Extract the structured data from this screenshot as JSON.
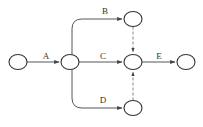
{
  "diagram": {
    "type": "activity-on-arrow network",
    "colors": {
      "node_stroke": "#333333",
      "edge": "#444444",
      "dummy": "#666666",
      "label": "#333333"
    },
    "nodes": [
      {
        "id": "n1",
        "cx": 18,
        "cy": 62,
        "rx": 9,
        "ry": 7.5
      },
      {
        "id": "n2",
        "cx": 70,
        "cy": 62,
        "rx": 9,
        "ry": 7.5
      },
      {
        "id": "n3",
        "cx": 133,
        "cy": 19,
        "rx": 9,
        "ry": 7.5
      },
      {
        "id": "n4",
        "cx": 133,
        "cy": 62,
        "rx": 9,
        "ry": 7.5
      },
      {
        "id": "n5",
        "cx": 186,
        "cy": 62,
        "rx": 9,
        "ry": 7.5
      },
      {
        "id": "n6",
        "cx": 133,
        "cy": 108,
        "rx": 9,
        "ry": 7.5
      }
    ],
    "activities": [
      {
        "label": "A",
        "from": "n1",
        "to": "n2",
        "dashed": false,
        "path": "M27,62 L59,62",
        "label_x": 46,
        "label_y": 59
      },
      {
        "label": "B",
        "from": "n2",
        "to": "n3",
        "dashed": false,
        "path": "M72,54.5 L72,29 Q72,19 82,19 L122,19",
        "label_x": 105,
        "label_y": 14
      },
      {
        "label": "C",
        "from": "n2",
        "to": "n4",
        "dashed": false,
        "path": "M79,62 L122,62",
        "label_x": 103,
        "label_y": 59
      },
      {
        "label": "D",
        "from": "n2",
        "to": "n6",
        "dashed": false,
        "path": "M72,69.5 L72,98 Q72,108 82,108 L122,108",
        "label_x": 103,
        "label_y": 103
      },
      {
        "label": "E",
        "from": "n4",
        "to": "n5",
        "dashed": false,
        "path": "M142,62 L175,62",
        "label_x": 159,
        "label_y": 59
      },
      {
        "label": "",
        "from": "n3",
        "to": "n4",
        "dashed": true,
        "path": "M133,26.5 L133,52"
      },
      {
        "label": "",
        "from": "n6",
        "to": "n4",
        "dashed": true,
        "path": "M133,100.5 L133,72"
      }
    ]
  }
}
